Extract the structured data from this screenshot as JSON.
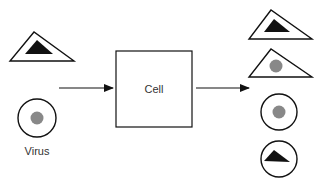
{
  "diagram": {
    "input_label": "Virus",
    "process_label": "Cell",
    "colors": {
      "stroke": "#111111",
      "dark_fill": "#111111",
      "gray_fill": "#888888",
      "background": "#ffffff",
      "text": "#333333"
    },
    "inputs": [
      {
        "shape": "triangle",
        "core": "black-triangle"
      },
      {
        "shape": "circle",
        "core": "gray-dot",
        "label": "Virus"
      }
    ],
    "outputs": [
      {
        "shape": "triangle",
        "core": "black-triangle"
      },
      {
        "shape": "triangle",
        "core": "gray-dot"
      },
      {
        "shape": "circle",
        "core": "gray-dot"
      },
      {
        "shape": "circle",
        "core": "black-triangle"
      }
    ]
  }
}
